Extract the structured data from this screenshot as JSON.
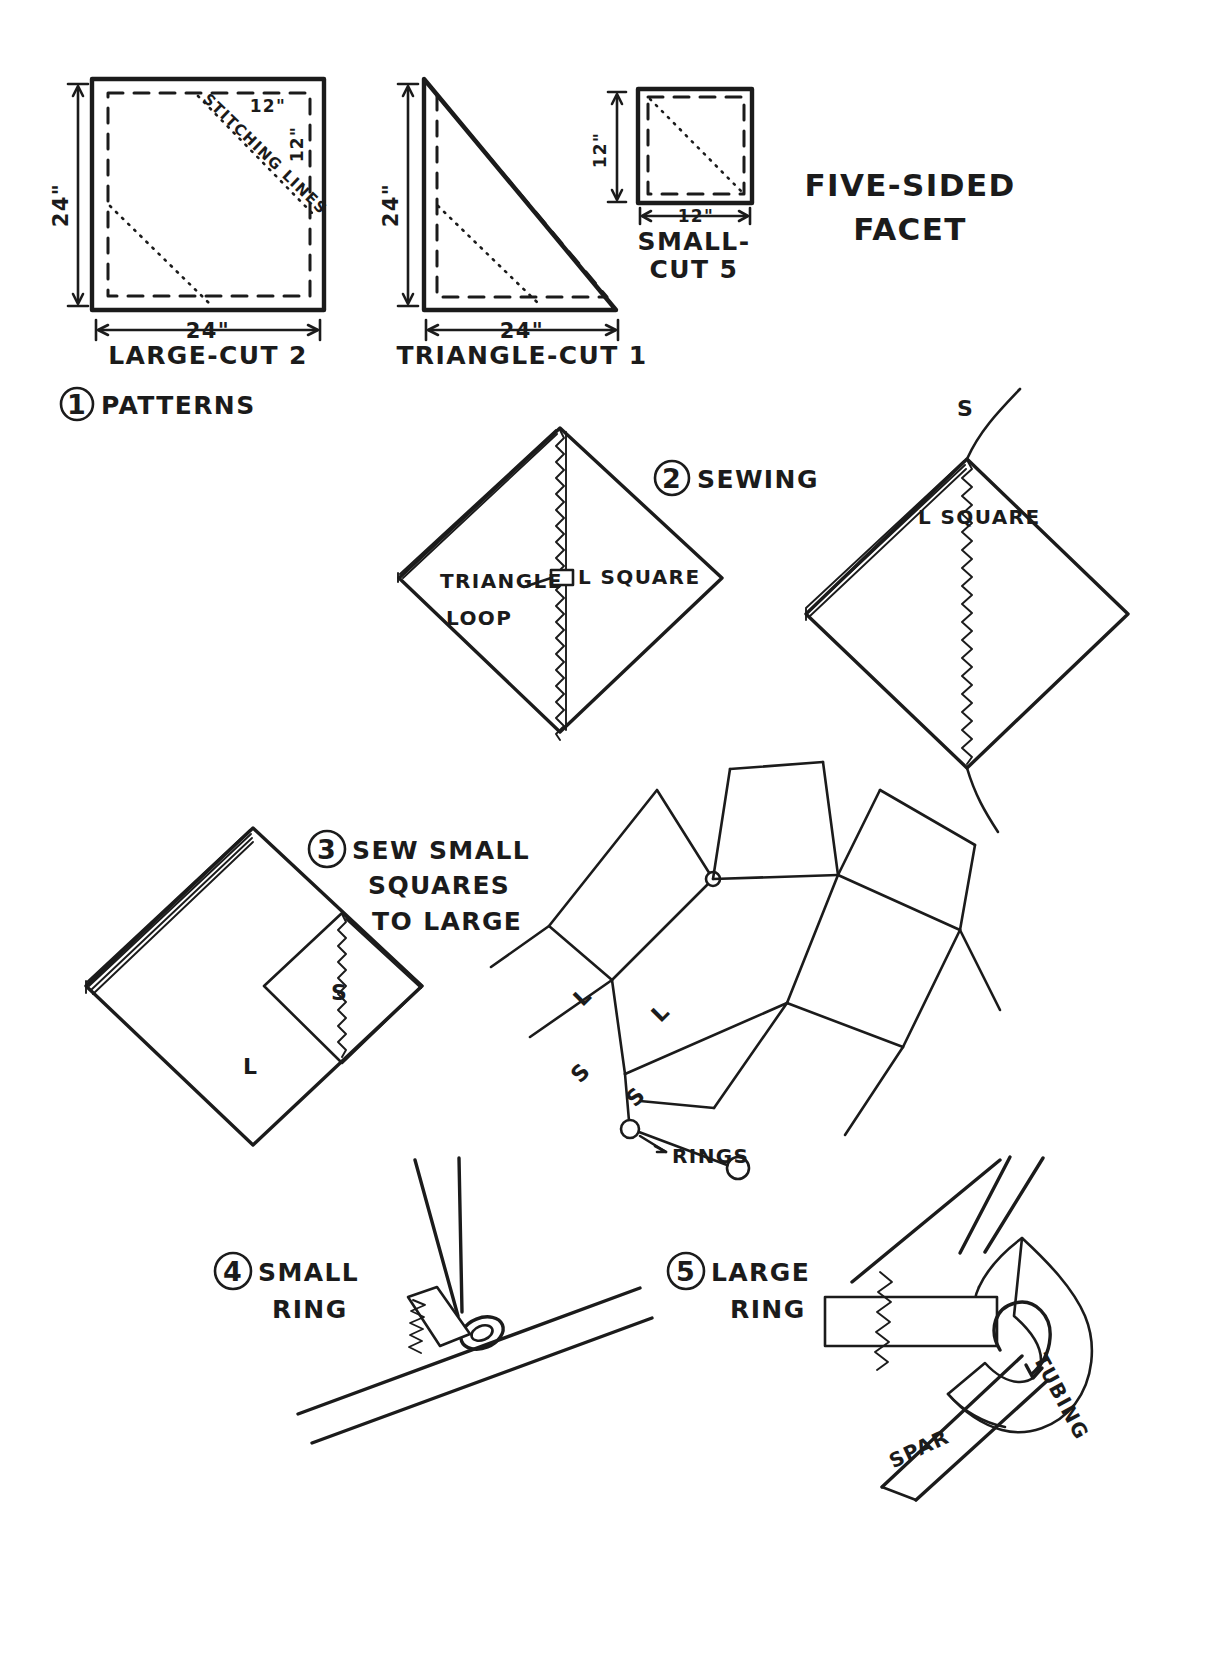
{
  "document": {
    "title": "FIVE-SIDED FACET",
    "title_line1": "FIVE-SIDED",
    "title_line2": "FACET",
    "kind": "hand-drawn kite construction plan"
  },
  "steps": [
    {
      "number": "1",
      "label": "PATTERNS"
    },
    {
      "number": "2",
      "label": "SEWING"
    },
    {
      "number": "3",
      "label_line1": "SEW SMALL",
      "label_line2": "SQUARES",
      "label_line3": "TO LARGE",
      "label": "SEW SMALL SQUARES TO LARGE"
    },
    {
      "number": "4",
      "label_line1": "SMALL",
      "label_line2": "RING",
      "label": "SMALL RING"
    },
    {
      "number": "5",
      "label_line1": "LARGE",
      "label_line2": "RING",
      "label": "LARGE RING"
    }
  ],
  "patterns": {
    "large": {
      "caption": "LARGE-CUT 2",
      "width_dim": "24\"",
      "height_dim": "24\"",
      "inner_dim_top": "12\"",
      "inner_dim_right": "12\"",
      "stitching_note": "STITCHING LINES"
    },
    "triangle": {
      "caption": "TRIANGLE-CUT 1",
      "width_dim": "24\"",
      "height_dim": "24\""
    },
    "small": {
      "caption_line1": "SMALL-",
      "caption_line2": "CUT 5",
      "caption": "SMALL-CUT 5",
      "width_dim": "12\"",
      "height_dim": "12\""
    }
  },
  "sewing": {
    "left_diagram": {
      "labels": [
        "TRIANGLE",
        "LOOP",
        "L SQUARE"
      ],
      "triangle_label": "TRIANGLE",
      "loop_label": "LOOP",
      "square_label": "L SQUARE"
    },
    "right_diagram": {
      "square_label": "L SQUARE",
      "seam_label": "S"
    }
  },
  "assembly": {
    "left_diagram": {
      "small_label": "S",
      "large_label": "L"
    },
    "facet_layout": {
      "labels": [
        "L",
        "L",
        "S",
        "S"
      ],
      "rings_label": "RINGS"
    }
  },
  "rings": {
    "large_ring_detail": {
      "tubing_label": "TUBING",
      "spar_label": "SPAR"
    }
  },
  "colors": {
    "ink": "#1b1b1b",
    "paper": "#ffffff"
  }
}
